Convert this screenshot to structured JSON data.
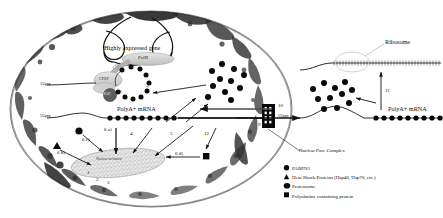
{
  "figure": {
    "background": "#ffffff",
    "ink": "#111111"
  },
  "nucleus": {
    "envelope_label": "nuclear-envelope",
    "gene_label": "Highly expressed gene",
    "polymerase_label": "PolII",
    "ctd_label": "CTD",
    "cpsf_label": "CPSF",
    "pap_label": "PAP",
    "cap_label_1": "5'Gppp",
    "cap_label_2": "5'Gppp",
    "mrna_label": "PolyA+ mRNA",
    "inclusion_label": "Nuclear inclusion"
  },
  "cytoplasm": {
    "ribosome_label": "Ribosome",
    "cap_label": "5'Gppp",
    "mrna_label": "PolyA+ mRNA"
  },
  "pore": {
    "label": "Nuclear Pore Complex"
  },
  "steps": {
    "s1": "1",
    "s2": "2",
    "s3": "3",
    "s4": "4",
    "s5": "5",
    "s5b": "5",
    "s6a": "6 a)",
    "s6b": "6 b)",
    "s6c": "6 c)",
    "s6d": "6 d)",
    "s7": "7",
    "s8": "8",
    "s9": "9",
    "s10": "10",
    "s11": "11",
    "s12": "12"
  },
  "legend": {
    "items": [
      {
        "glyph": "●",
        "shape": "circle",
        "label": "PABPN1"
      },
      {
        "glyph": "▲",
        "shape": "triangle",
        "label": "Heat Shock Proteins (Hsp40, Hsp70, etc.)"
      },
      {
        "glyph": "⬬",
        "shape": "ellipse",
        "label": "Proteasome"
      },
      {
        "glyph": "■",
        "shape": "square",
        "label": "Polyalanine containing protein"
      }
    ]
  }
}
